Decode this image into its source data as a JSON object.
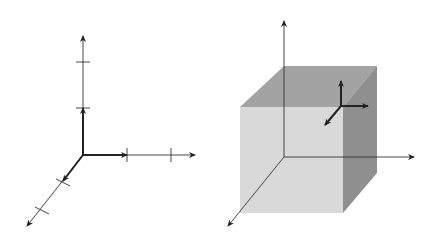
{
  "left_diagram": {
    "axes": {
      "x_label": "x",
      "y_label": "y",
      "z_label": "z"
    },
    "ticks": {
      "x": [
        "1",
        "2"
      ],
      "y": [
        "1",
        "2"
      ],
      "z": [
        "1",
        "2"
      ]
    },
    "unit_vectors": {
      "i": "î",
      "j": "ĵ",
      "k": "k̂"
    }
  },
  "right_diagram": {
    "axes": {
      "x_label": "x",
      "y_label": "y",
      "z_label": "z"
    },
    "unit_vectors": {
      "i": "î",
      "j": "ĵ",
      "k": "k̂"
    },
    "colors": {
      "front_face": "#d9d9d9",
      "top_face": "#a3a3a3",
      "side_face": "#8f8f8f"
    }
  }
}
